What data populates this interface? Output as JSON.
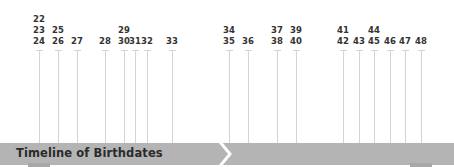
{
  "title": "Timeline of Birthdates",
  "colors": {
    "bar": "#b4b4b4",
    "stem": "#d4d4d4",
    "label": "#333333",
    "title": "#2b2b2b",
    "chevron": "#ffffff"
  },
  "markers": [
    {
      "x": 39,
      "labels": [
        "22",
        "23",
        "24"
      ]
    },
    {
      "x": 58,
      "labels": [
        "25",
        "26"
      ]
    },
    {
      "x": 77,
      "labels": [
        "27"
      ]
    },
    {
      "x": 105,
      "labels": [
        "28"
      ]
    },
    {
      "x": 124,
      "labels": [
        "29",
        "30"
      ]
    },
    {
      "x": 135,
      "labels": [
        "31"
      ]
    },
    {
      "x": 147,
      "labels": [
        "32"
      ]
    },
    {
      "x": 172,
      "labels": [
        "33"
      ]
    },
    {
      "x": 229,
      "labels": [
        "34",
        "35"
      ]
    },
    {
      "x": 248,
      "labels": [
        "36"
      ]
    },
    {
      "x": 277,
      "labels": [
        "37",
        "38"
      ]
    },
    {
      "x": 296,
      "labels": [
        "39",
        "40"
      ]
    },
    {
      "x": 343,
      "labels": [
        "41",
        "42"
      ]
    },
    {
      "x": 359,
      "labels": [
        "43"
      ]
    },
    {
      "x": 374,
      "labels": [
        "44",
        "45"
      ]
    },
    {
      "x": 390,
      "labels": [
        "46"
      ]
    },
    {
      "x": 405,
      "labels": [
        "47"
      ]
    },
    {
      "x": 421,
      "labels": [
        "48"
      ]
    }
  ]
}
